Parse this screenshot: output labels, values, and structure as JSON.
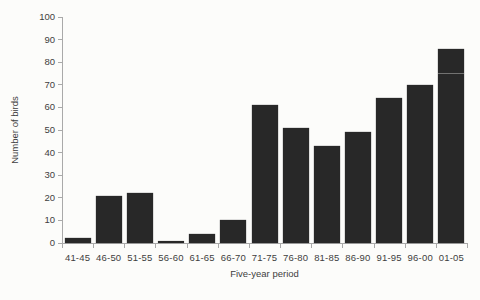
{
  "chart_data": {
    "type": "bar",
    "title": "",
    "categories": [
      "41-45",
      "46-50",
      "51-55",
      "56-60",
      "61-65",
      "66-70",
      "71-75",
      "76-80",
      "81-85",
      "86-90",
      "91-95",
      "96-00",
      "01-05"
    ],
    "values": [
      2,
      21,
      22,
      1,
      4,
      10,
      61,
      51,
      43,
      49,
      64,
      70,
      86
    ],
    "xlabel": "Five-year period",
    "ylabel": "Number of birds",
    "ylim": [
      0,
      100
    ],
    "yticks": [
      0,
      10,
      20,
      30,
      40,
      50,
      60,
      70,
      80,
      90,
      100
    ],
    "grid": false,
    "legend": false,
    "colors": {
      "bar": "#282828",
      "axis": "#a9a9a9",
      "text": "#3e3e3e",
      "background": "#fcfcfa"
    }
  }
}
